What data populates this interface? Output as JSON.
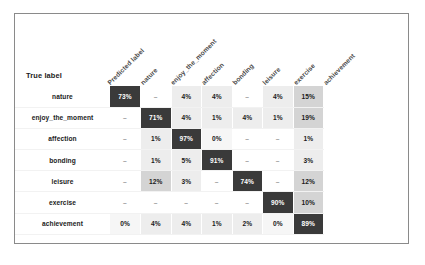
{
  "chart_data": {
    "type": "heatmap",
    "title": "",
    "xlabel": "Predicted label",
    "ylabel": "True label",
    "categories": [
      "nature",
      "enjoy_the_moment",
      "affection",
      "bonding",
      "leisure",
      "exercise",
      "achievement"
    ],
    "column_headers": [
      "nature",
      "enjoy_the_moment",
      "affection",
      "bonding",
      "leisure",
      "exercise",
      "achievement"
    ],
    "row_headers": [
      "nature",
      "enjoy_the_moment",
      "affection",
      "bonding",
      "leisure",
      "exercise",
      "achievement"
    ],
    "corner_label": "True label",
    "axis_label_rotated": "Predicted label",
    "cell_text": [
      [
        "73%",
        "–",
        "4%",
        "4%",
        "–",
        "4%",
        "15%"
      ],
      [
        "–",
        "71%",
        "4%",
        "1%",
        "4%",
        "1%",
        "19%"
      ],
      [
        "–",
        "1%",
        "97%",
        "0%",
        "–",
        "–",
        "1%"
      ],
      [
        "–",
        "1%",
        "5%",
        "91%",
        "–",
        "–",
        "3%"
      ],
      [
        "–",
        "12%",
        "3%",
        "–",
        "74%",
        "–",
        "12%"
      ],
      [
        "–",
        "–",
        "–",
        "–",
        "–",
        "90%",
        "10%"
      ],
      [
        "0%",
        "4%",
        "4%",
        "1%",
        "2%",
        "0%",
        "89%"
      ]
    ],
    "values": [
      [
        73,
        null,
        4,
        4,
        null,
        4,
        15
      ],
      [
        null,
        71,
        4,
        1,
        4,
        1,
        19
      ],
      [
        null,
        1,
        97,
        0,
        null,
        null,
        1
      ],
      [
        null,
        1,
        5,
        91,
        null,
        null,
        3
      ],
      [
        null,
        12,
        3,
        null,
        74,
        null,
        12
      ],
      [
        null,
        null,
        null,
        null,
        null,
        90,
        10
      ],
      [
        0,
        4,
        4,
        1,
        2,
        0,
        89
      ]
    ],
    "value_unit": "%",
    "missing_marker": "–",
    "colorscale": "grayscale",
    "grid": true,
    "legend": "none"
  },
  "figure": {
    "caption": ""
  },
  "colors": {
    "frame_border": "#8a8a8a",
    "cell_high": "#3a3a3a",
    "cell_mid": "#d4d4d4",
    "cell_low": "#ededed",
    "cell_zero": "#ffffff",
    "text_dark": "#1b1b1b",
    "text_light": "#ffffff",
    "header_label": "#4a4a4a"
  }
}
